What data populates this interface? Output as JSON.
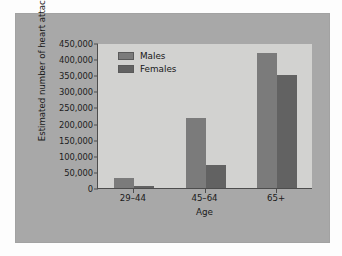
{
  "chart_data": {
    "type": "bar",
    "title": "",
    "xlabel": "Age",
    "ylabel": "Estimated number of heart attacks",
    "categories": [
      "29–44",
      "45–64",
      "65+"
    ],
    "series": [
      {
        "name": "Males",
        "values": [
          30000,
          218000,
          420000
        ],
        "color": "#7b7b7b"
      },
      {
        "name": "Females",
        "values": [
          5000,
          70000,
          350000
        ],
        "color": "#626262"
      }
    ],
    "ylim": [
      0,
      450000
    ],
    "yticks": [
      0,
      50000,
      100000,
      150000,
      200000,
      250000,
      300000,
      350000,
      400000,
      450000
    ],
    "ytick_labels": [
      "0",
      "50,000",
      "100,000",
      "150,000",
      "200,000",
      "250,000",
      "300,000",
      "350,000",
      "400,000",
      "450,000"
    ],
    "grid": false,
    "legend_position": "top-left"
  },
  "legend": {
    "entries": [
      {
        "label": "Males"
      },
      {
        "label": "Females"
      }
    ]
  },
  "axes": {
    "x_title": "Age",
    "y_title": "Estimated number of heart attacks"
  },
  "colors": {
    "panel_background": "#a8a8a8",
    "plot_background": "#d2d2d0",
    "axis_line": "#4d4d4d",
    "males_bar": "#7b7b7b",
    "females_bar": "#626262",
    "text": "#1a1a1a"
  }
}
